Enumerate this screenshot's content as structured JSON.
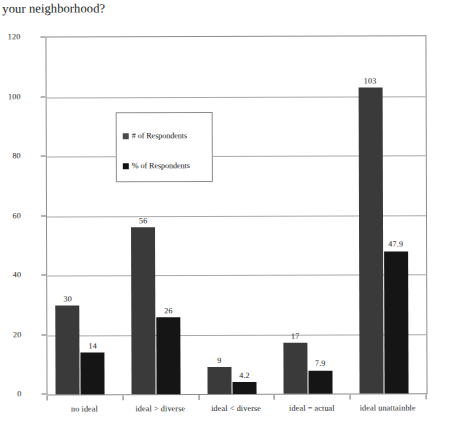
{
  "question": {
    "text": "your neighborhood?"
  },
  "legend": {
    "position": "inside-top-left",
    "entries": [
      {
        "label": "# of Respondents",
        "color": "#3a3a3a",
        "marker": "square-swatch-icon"
      },
      {
        "label": "% of Respondents",
        "color": "#151515",
        "marker": "square-swatch-icon"
      }
    ]
  },
  "axes": {
    "y_ticks": [
      "0",
      "20",
      "40",
      "60",
      "80",
      "100",
      "120"
    ],
    "x_ticks": [
      "no ideal",
      "ideal > diverse",
      "ideal < diverse",
      "ideal = actual",
      "ideal unattainble"
    ]
  },
  "chart_data": {
    "type": "bar",
    "title": "your neighborhood?",
    "xlabel": "",
    "ylabel": "",
    "ylim": [
      0,
      120
    ],
    "ytick_step": 20,
    "grid": true,
    "legend_position": "inside-top-left",
    "categories": [
      "no ideal",
      "ideal > diverse",
      "ideal < diverse",
      "ideal = actual",
      "ideal unattainble"
    ],
    "series": [
      {
        "name": "# of Respondents",
        "color": "#3a3a3a",
        "values": [
          30,
          56,
          9,
          17,
          103
        ],
        "labels": [
          "30",
          "56",
          "9",
          "17",
          "103"
        ]
      },
      {
        "name": "% of Respondents",
        "color": "#151515",
        "values": [
          14,
          26,
          4.2,
          7.9,
          47.9
        ],
        "labels": [
          "14",
          "26",
          "4.2",
          "7.9",
          "47.9"
        ]
      }
    ]
  }
}
